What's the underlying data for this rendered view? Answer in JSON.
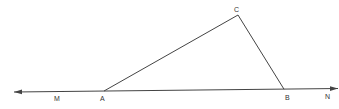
{
  "diagram": {
    "type": "geometry-triangle-on-line",
    "line_color": "#444444",
    "labels": {
      "M": "M",
      "A": "A",
      "B": "B",
      "C": "C",
      "N": "N"
    },
    "elements": [
      {
        "kind": "line",
        "name": "MN",
        "arrows": "both",
        "points_on_line": [
          "M",
          "A",
          "B",
          "N"
        ]
      },
      {
        "kind": "segment",
        "name": "AC"
      },
      {
        "kind": "segment",
        "name": "CB"
      }
    ]
  }
}
